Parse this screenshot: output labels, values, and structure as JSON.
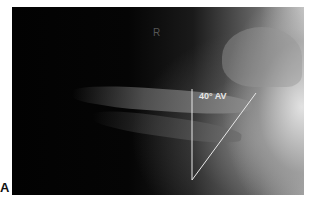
{
  "figure": {
    "panel_label": "A",
    "side_marker": "R",
    "angle_annotation": "40° AV",
    "line_color": "#e8e8e8",
    "background_color": "#000000"
  }
}
